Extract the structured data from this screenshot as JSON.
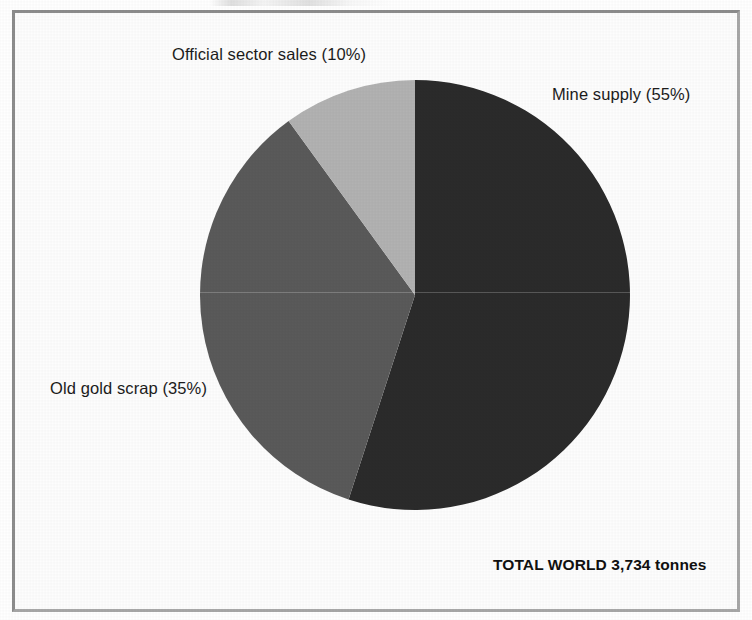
{
  "figure": {
    "frame_border_color": "#9b9b9b",
    "background_color": "#ffffff"
  },
  "labels": {
    "official_sector_sales": "Official sector sales (10%)",
    "mine_supply": "Mine supply (55%)",
    "old_gold_scrap": "Old gold scrap (35%)",
    "total": "TOTAL WORLD 3,734 tonnes"
  },
  "chart_data": {
    "type": "pie",
    "title": "",
    "subtitle": "",
    "xlabel": "",
    "ylabel": "",
    "total_label": "TOTAL WORLD 3,734 tonnes",
    "total_value": 3734,
    "units": "tonnes",
    "legend_position": "callout-labels",
    "grid": false,
    "start_angle_deg": 0,
    "direction": "clockwise",
    "categories": [
      "Mine supply",
      "Old gold scrap",
      "Official sector sales"
    ],
    "values": [
      55,
      35,
      10
    ],
    "value_unit": "percent",
    "absolute_values": [
      2054,
      1307,
      373
    ],
    "colors": [
      "#2b2b2b",
      "#5a5a5a",
      "#b2b2b2"
    ],
    "slices": [
      {
        "name": "Mine supply",
        "label": "Mine supply (55%)",
        "percent": 55,
        "color": "#2b2b2b",
        "start_deg": 0,
        "end_deg": 198
      },
      {
        "name": "Old gold scrap",
        "label": "Old gold scrap (35%)",
        "percent": 35,
        "color": "#5a5a5a",
        "start_deg": 198,
        "end_deg": 324
      },
      {
        "name": "Official sector sales",
        "label": "Official sector sales (10%)",
        "percent": 10,
        "color": "#b2b2b2",
        "start_deg": 324,
        "end_deg": 360
      }
    ]
  }
}
